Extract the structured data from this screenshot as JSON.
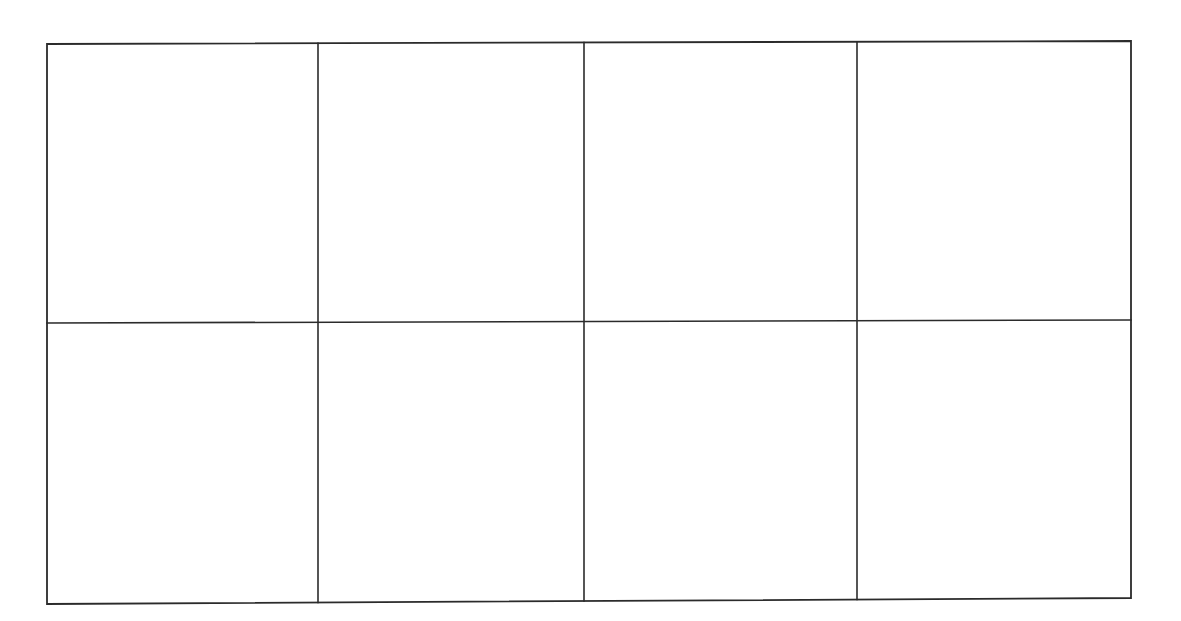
{
  "document": {
    "kind": "blank-grid-table",
    "description": "Empty four-column by two-row grid of blank rectangular cells on a white page",
    "page_width": 1181,
    "page_height": 621,
    "background_color": "#ffffff"
  },
  "grid": {
    "columns": 4,
    "rows": 2,
    "total_cells": 8,
    "line_color": "#2b2b2b",
    "line_width": 1.6,
    "outer_border_width": 1.8,
    "tilt_degrees": -0.2,
    "bounds": {
      "left": 47,
      "right": 1131,
      "top_left_y": 44,
      "top_right_y": 41,
      "bottom_left_y": 604,
      "bottom_right_y": 598
    },
    "column_divider_x": [
      318,
      584,
      857
    ],
    "row_divider_y": {
      "left": 323,
      "right": 320
    },
    "column_edges_x": [
      47,
      318,
      584,
      857,
      1131
    ],
    "column_labels": [
      "column-1",
      "column-2",
      "column-3",
      "column-4"
    ],
    "row_labels": [
      "row-1",
      "row-2"
    ]
  },
  "cells": [
    {
      "id": "r1c1",
      "row": 1,
      "column": 1,
      "text": ""
    },
    {
      "id": "r1c2",
      "row": 1,
      "column": 2,
      "text": ""
    },
    {
      "id": "r1c3",
      "row": 1,
      "column": 3,
      "text": ""
    },
    {
      "id": "r1c4",
      "row": 1,
      "column": 4,
      "text": ""
    },
    {
      "id": "r2c1",
      "row": 2,
      "column": 1,
      "text": ""
    },
    {
      "id": "r2c2",
      "row": 2,
      "column": 2,
      "text": ""
    },
    {
      "id": "r2c3",
      "row": 2,
      "column": 3,
      "text": ""
    },
    {
      "id": "r2c4",
      "row": 2,
      "column": 4,
      "text": ""
    }
  ]
}
